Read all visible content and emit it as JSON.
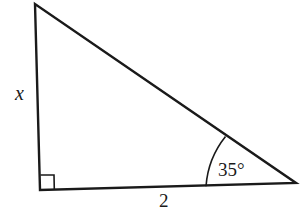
{
  "figure": {
    "type": "right-triangle",
    "vertices": {
      "top": [
        35,
        4
      ],
      "right_angle": [
        40,
        190
      ],
      "right": [
        296,
        183
      ]
    },
    "labels": {
      "vertical_side": "x",
      "base_side": "2",
      "angle": "35°"
    },
    "angle_marker": "arc",
    "right_angle_marker": "square",
    "stroke_color": "#1a1a1a",
    "background": "#ffffff"
  }
}
